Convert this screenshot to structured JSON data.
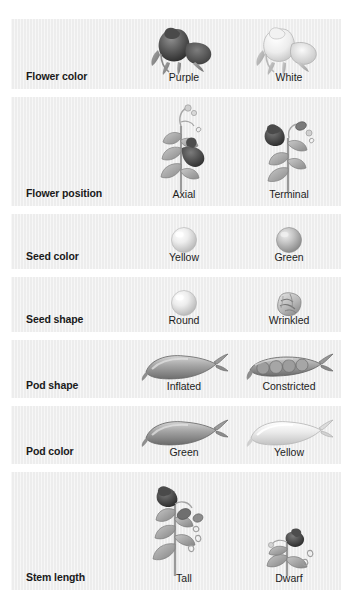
{
  "figure": {
    "background_color": "#ffffff",
    "row_color": "#ededed",
    "label_color": "#1a1a1a",
    "caption_color": "#1c1c1c",
    "rendering": "grayscale halftone illustrations"
  },
  "rows": [
    {
      "label": "Flower color",
      "variants": [
        {
          "caption": "Purple",
          "icon": "purple-flower-icon",
          "tone": "dark"
        },
        {
          "caption": "White",
          "icon": "white-flower-icon",
          "tone": "light"
        }
      ]
    },
    {
      "label": "Flower position",
      "variants": [
        {
          "caption": "Axial",
          "icon": "axial-flower-stem-icon",
          "tone": "mixed"
        },
        {
          "caption": "Terminal",
          "icon": "terminal-flower-stem-icon",
          "tone": "mixed"
        }
      ]
    },
    {
      "label": "Seed color",
      "variants": [
        {
          "caption": "Yellow",
          "icon": "yellow-seed-icon",
          "tone": "light"
        },
        {
          "caption": "Green",
          "icon": "green-seed-icon",
          "tone": "medium"
        }
      ]
    },
    {
      "label": "Seed shape",
      "variants": [
        {
          "caption": "Round",
          "icon": "round-seed-icon",
          "tone": "light"
        },
        {
          "caption": "Wrinkled",
          "icon": "wrinkled-seed-icon",
          "tone": "medium"
        }
      ]
    },
    {
      "label": "Pod shape",
      "variants": [
        {
          "caption": "Inflated",
          "icon": "inflated-pod-icon",
          "tone": "medium"
        },
        {
          "caption": "Constricted",
          "icon": "constricted-pod-icon",
          "tone": "medium"
        }
      ]
    },
    {
      "label": "Pod color",
      "variants": [
        {
          "caption": "Green",
          "icon": "green-pod-icon",
          "tone": "medium"
        },
        {
          "caption": "Yellow",
          "icon": "yellow-pod-icon",
          "tone": "light"
        }
      ]
    },
    {
      "label": "Stem length",
      "variants": [
        {
          "caption": "Tall",
          "icon": "tall-pea-plant-icon",
          "tone": "mixed"
        },
        {
          "caption": "Dwarf",
          "icon": "dwarf-pea-plant-icon",
          "tone": "mixed"
        }
      ]
    }
  ]
}
